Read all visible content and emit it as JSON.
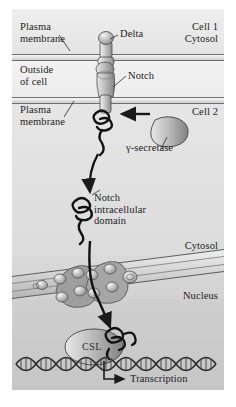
{
  "figure": {
    "background": "#e9e9e9",
    "panel": {
      "width": 212,
      "height": 381
    }
  },
  "compartments": [
    {
      "id": "cell1",
      "label": "Cell 1",
      "sublabel": "Cytosol"
    },
    {
      "id": "outside",
      "label": "Outside\nof cell"
    },
    {
      "id": "cell2",
      "label": "Cell 2"
    },
    {
      "id": "cytosol2",
      "label": "Cytosol"
    },
    {
      "id": "nucleus",
      "label": "Nucleus"
    }
  ],
  "labels": {
    "plasma_membrane_top": "Plasma\nmembrane",
    "outside_of_cell": "Outside\nof cell",
    "plasma_membrane_bottom": "Plasma\nmembrane",
    "cell_1": "Cell 1",
    "cytosol_top": "Cytosol",
    "cell_2": "Cell 2",
    "delta": "Delta",
    "notch": "Notch",
    "gamma_secretase": "γ-secretase",
    "notch_intracellular_domain": "Notch\nintracellular\ndomain",
    "cytosol_bottom": "Cytosol",
    "nucleus": "Nucleus",
    "csl": "CSL",
    "transcription": "Transcription"
  },
  "structures": {
    "delta_ligand": "delta-ligand",
    "notch_receptor": "notch-receptor",
    "gamma_secretase_enzyme": "gamma-secretase-enzyme",
    "nicd_coil": "notch-intracellular-domain-coil",
    "nuclear_envelope": "nuclear-envelope",
    "nuclear_pores": 2,
    "dna_helix": "dna-double-helix",
    "csl_protein": "csl-protein"
  },
  "arrows": {
    "cleavage_arrow": "gamma-secretase-cleavage-arrow",
    "release_arrow": "nicd-release-arrow",
    "translocation_arrow": "nicd-nuclear-translocation-arrow",
    "transcription_arrow": "transcription-arrow"
  },
  "colors": {
    "ink": "#1d1d1d",
    "membrane_line": "#6f6f6f",
    "protein_fill": "#b9b9b9",
    "protein_stroke": "#4a4a4a",
    "nucleus_bg": "#c6c6c6",
    "cell1_bg": "#eeeeee",
    "cell2_bg": "#e0e0e0"
  }
}
